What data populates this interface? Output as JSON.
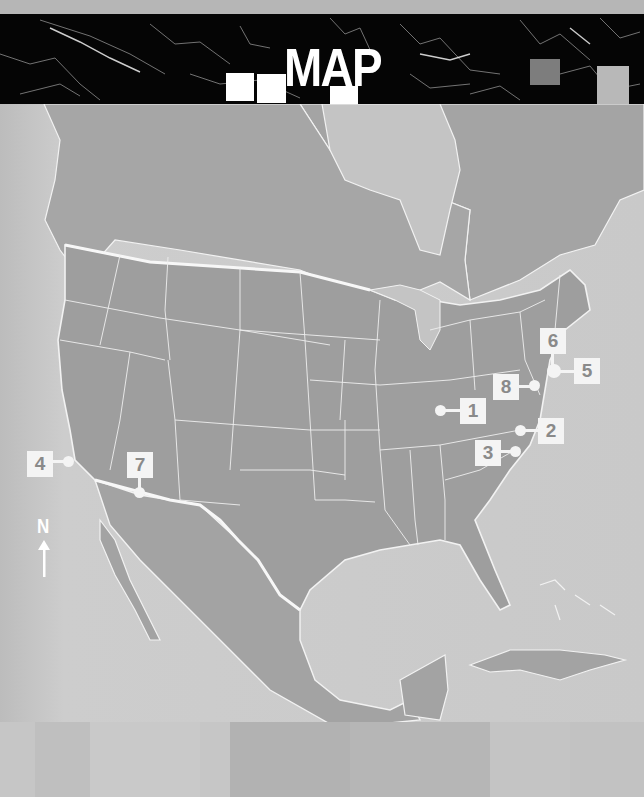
{
  "header": {
    "title": "MAP",
    "background": "#050505",
    "accent_boxes": [
      {
        "color": "#ffffff"
      },
      {
        "color": "#ffffff"
      },
      {
        "color": "#ffffff"
      },
      {
        "color": "#7d7d7d"
      },
      {
        "color": "#b8b8b8"
      }
    ]
  },
  "map": {
    "region": "North America",
    "land_color": "#9e9e9e",
    "water_color": "#c6c6c6",
    "border_color": "#f2f2f2",
    "compass": {
      "label": "N",
      "icon": "north-arrow-icon"
    },
    "markers": [
      {
        "number": "1"
      },
      {
        "number": "2"
      },
      {
        "number": "3"
      },
      {
        "number": "4"
      },
      {
        "number": "5"
      },
      {
        "number": "6"
      },
      {
        "number": "7"
      },
      {
        "number": "8"
      }
    ]
  }
}
